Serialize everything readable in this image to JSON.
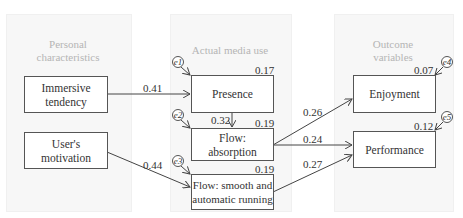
{
  "panels": [
    {
      "title_line1": "Personal",
      "title_line2": "characteristics"
    },
    {
      "title_line1": "Actual media use",
      "title_line2": ""
    },
    {
      "title_line1": "Outcome",
      "title_line2": "variables"
    }
  ],
  "nodes": {
    "immersive": {
      "line1": "Immersive",
      "line2": "tendency"
    },
    "motivation": {
      "line1": "User's",
      "line2": "motivation"
    },
    "presence": {
      "line1": "Presence"
    },
    "absorption": {
      "line1": "Flow:",
      "line2": "absorption"
    },
    "smooth": {
      "line1": "Flow: smooth and",
      "line2": "automatic running"
    },
    "enjoyment": {
      "line1": "Enjoyment"
    },
    "performance": {
      "line1": "Performance"
    }
  },
  "r_squared": {
    "presence": "0.17",
    "absorption": "0.19",
    "smooth": "0.19",
    "enjoyment": "0.07",
    "performance": "0.12"
  },
  "paths": {
    "immersive_presence": "0.41",
    "presence_absorption": "0.32",
    "motivation_smooth": "0.44",
    "absorption_enjoyment": "0.26",
    "absorption_performance": "0.24",
    "smooth_performance": "0.27"
  },
  "errors": [
    "e1",
    "e2",
    "e3",
    "e4",
    "e5"
  ]
}
